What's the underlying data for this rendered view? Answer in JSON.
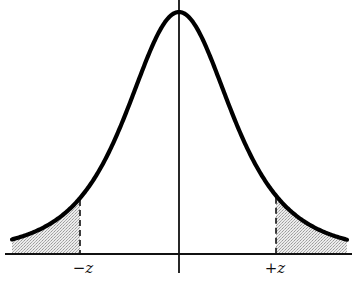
{
  "figure": {
    "labels": {
      "left_critical": "−z",
      "right_critical": "+z"
    },
    "colors": {
      "curve": "#000000",
      "axis": "#111111",
      "tail_shading": "#d8d8d8",
      "background": "#ffffff"
    },
    "geometry": {
      "baseline_y": 254,
      "baseline_x_start": 5,
      "baseline_x_end": 352,
      "center_x": 179,
      "axis_top_y": 0,
      "axis_bottom_y": 273,
      "peak_height": 242,
      "scale": 55,
      "dof": 3,
      "curve_x_start": 12,
      "curve_x_end": 347,
      "neg_z_x": 80,
      "pos_z_x": 276,
      "label_y": 273
    },
    "shaded_regions": [
      "left tail (x < -z)",
      "right tail (x > +z)"
    ]
  }
}
